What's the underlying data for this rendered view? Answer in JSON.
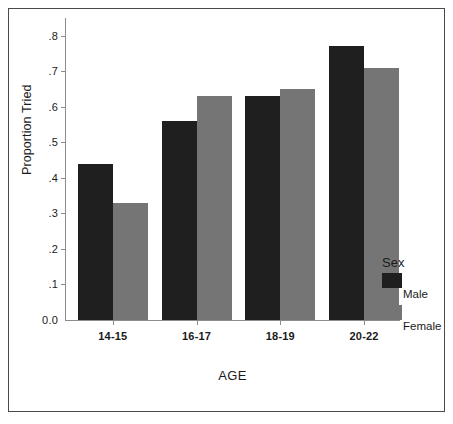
{
  "chart_data": {
    "type": "bar",
    "title": "",
    "xlabel": "AGE",
    "ylabel": "Proportion Tried",
    "categories": [
      "14-15",
      "16-17",
      "18-19",
      "20-22"
    ],
    "series": [
      {
        "name": "Male",
        "color": "#1f1f1f",
        "values": [
          0.44,
          0.56,
          0.63,
          0.77
        ]
      },
      {
        "name": "Female",
        "color": "#757575",
        "values": [
          0.33,
          0.63,
          0.65,
          0.71
        ]
      }
    ],
    "ylim": [
      0.0,
      0.85
    ],
    "ytick_values": [
      0.0,
      0.1,
      0.2,
      0.3,
      0.4,
      0.5,
      0.6,
      0.7,
      0.8
    ],
    "ytick_labels": [
      "0.0",
      ".1",
      ".2",
      ".3",
      ".4",
      ".5",
      ".6",
      ".7",
      ".8"
    ],
    "grid": false,
    "legend": {
      "title": "Sex",
      "position": "right-bottom",
      "entries": [
        "Male",
        "Female"
      ]
    }
  },
  "axes": {
    "y_title": "Proportion Tried",
    "x_title": "AGE"
  },
  "legend": {
    "title": "Sex",
    "items": [
      {
        "label": "Male",
        "color": "#1f1f1f"
      },
      {
        "label": "Female",
        "color": "#757575"
      }
    ]
  },
  "colors": {
    "male": "#1f1f1f",
    "female": "#757575",
    "axis": "#8c8c8c",
    "frame": "#4a4a4a",
    "text": "#1a1a1a",
    "background": "#ffffff"
  }
}
